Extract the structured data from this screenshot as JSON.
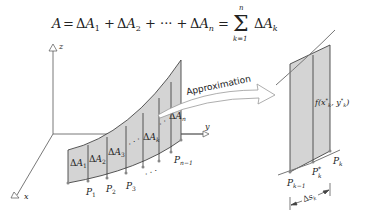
{
  "formula": {
    "lhs": "A",
    "terms": [
      "ΔA",
      "ΔA",
      "ΔA"
    ],
    "subscripts": [
      "1",
      "2",
      "n"
    ],
    "sum_upper": "n",
    "sum_lower": "k=1",
    "sum_term": "ΔA",
    "sum_term_sub": "k",
    "text": "A = ΔA₁ + ΔA₂ + ··· + ΔAₙ = Σ_{k=1}^{n} ΔA_k"
  },
  "left_figure": {
    "axes": {
      "x": "x",
      "y": "y",
      "z": "z"
    },
    "strip_labels": [
      "ΔA1",
      "ΔA2",
      "ΔA3",
      "ΔAk",
      "ΔAn"
    ],
    "points": [
      "P1",
      "P2",
      "P3",
      "Pn−1"
    ],
    "ellipsis": "· · ·"
  },
  "arrow": {
    "label": "Approximation"
  },
  "right_figure": {
    "height_label": "f(x*k, y*k)",
    "points": [
      "Pk−1",
      "P*k",
      "Pk"
    ],
    "arc_length": "Δsk"
  },
  "colors": {
    "fill": "#d4d4d4",
    "stroke": "#444444",
    "curve": "#777777",
    "text": "#222222"
  }
}
